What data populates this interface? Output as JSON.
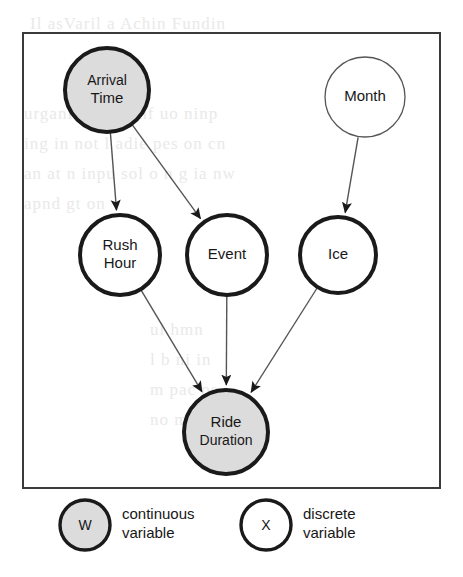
{
  "figure": {
    "kind": "bayesian-network-diagram"
  },
  "colors": {
    "continuous_fill": "#dcdcdc",
    "discrete_fill": "#ffffff",
    "stroke": "#1a1a1a",
    "thin_stroke": "#555555",
    "frame": "#3a3a3a",
    "background": "#ffffff"
  },
  "frame": {
    "x": 23,
    "y": 33,
    "width": 417,
    "height": 455
  },
  "graph": {
    "nodes": [
      {
        "id": "arrival_time",
        "label_lines": [
          "Arrival",
          "Time"
        ],
        "label": "Arrival Time",
        "cx": 107,
        "cy": 90,
        "r": 42,
        "type": "continuous",
        "shaded": true,
        "border": "thick"
      },
      {
        "id": "month",
        "label_lines": [
          "Month"
        ],
        "label": "Month",
        "cx": 365,
        "cy": 97,
        "r": 40,
        "type": "discrete",
        "shaded": false,
        "border": "thin"
      },
      {
        "id": "rush_hour",
        "label_lines": [
          "Rush",
          "Hour"
        ],
        "label": "Rush Hour",
        "cx": 120,
        "cy": 255,
        "r": 40,
        "type": "discrete",
        "shaded": false,
        "border": "thick"
      },
      {
        "id": "event",
        "label_lines": [
          "Event"
        ],
        "label": "Event",
        "cx": 227,
        "cy": 255,
        "r": 40,
        "type": "discrete",
        "shaded": false,
        "border": "thick"
      },
      {
        "id": "ice",
        "label_lines": [
          "Ice"
        ],
        "label": "Ice",
        "cx": 338,
        "cy": 255,
        "r": 38,
        "type": "discrete",
        "shaded": false,
        "border": "thick"
      },
      {
        "id": "ride_duration",
        "label_lines": [
          "Ride",
          "Duration"
        ],
        "label": "Ride Duration",
        "cx": 226,
        "cy": 432,
        "r": 42,
        "type": "continuous",
        "shaded": true,
        "border": "thick"
      }
    ],
    "edges": [
      {
        "from": "arrival_time",
        "to": "rush_hour"
      },
      {
        "from": "arrival_time",
        "to": "event"
      },
      {
        "from": "month",
        "to": "ice"
      },
      {
        "from": "rush_hour",
        "to": "ride_duration"
      },
      {
        "from": "event",
        "to": "ride_duration"
      },
      {
        "from": "ice",
        "to": "ride_duration"
      }
    ]
  },
  "legend": {
    "items": [
      {
        "symbol": "W",
        "text_lines": [
          "continuous",
          "variable"
        ],
        "text": "continuous variable",
        "shaded": true,
        "cx": 85,
        "cy": 525,
        "r": 25,
        "text_x": 122
      },
      {
        "symbol": "X",
        "text_lines": [
          "discrete",
          "variable"
        ],
        "text": "discrete variable",
        "shaded": false,
        "cx": 266,
        "cy": 525,
        "r": 25,
        "text_x": 303
      }
    ]
  },
  "scan_bleed": [
    {
      "text": "Il asVaril a Achin Fundin",
      "x": 30,
      "y": 14,
      "size": 17
    },
    {
      "text": "urgani nidi vv nf  uo ninp",
      "x": 24,
      "y": 104,
      "size": 17
    },
    {
      "text": "ing in not l adie pes on cn",
      "x": 24,
      "y": 134,
      "size": 17
    },
    {
      "text": "an at n  inpu sol o  n g ia nw",
      "x": 24,
      "y": 164,
      "size": 17
    },
    {
      "text": "apnd gt on",
      "x": 24,
      "y": 194,
      "size": 17
    },
    {
      "text": "ul  hmn",
      "x": 150,
      "y": 320,
      "size": 17
    },
    {
      "text": "l  b ni in",
      "x": 150,
      "y": 350,
      "size": 17
    },
    {
      "text": "m   pac   os",
      "x": 150,
      "y": 380,
      "size": 17
    },
    {
      "text": "no  m   y",
      "x": 150,
      "y": 410,
      "size": 17
    }
  ]
}
